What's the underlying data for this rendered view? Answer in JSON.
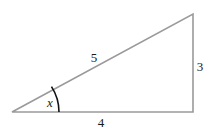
{
  "diagram": {
    "type": "right-triangle",
    "sides": {
      "hypotenuse": "5",
      "vertical": "3",
      "base": "4"
    },
    "angle_label": "x",
    "colors": {
      "line": "#9a9a9a",
      "arc": "#111111",
      "text": "#1a1a1a"
    }
  }
}
